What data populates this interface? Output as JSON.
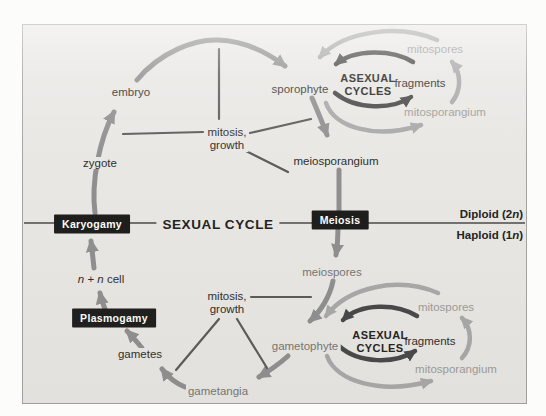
{
  "figure": {
    "type": "life-cycle-diagram",
    "halves": {
      "top": "Diploid (2n)",
      "bottom": "Haploid (1n)"
    }
  },
  "labels": {
    "embryo": "embryo",
    "zygote": "zygote",
    "sporophyte": "sporophyte",
    "meiosporangium": "meiosporangium",
    "meiospores": "meiospores",
    "gametophyte": "gametophyte",
    "gametangia": "gametangia",
    "gametes": "gametes",
    "fragments_top": "fragments",
    "fragments_bottom": "fragments",
    "mitospores_top": "mitospores",
    "mitosporangium_top": "mitosporangium",
    "mitospores_bottom": "mitospores",
    "mitosporangium_bottom": "mitosporangium",
    "mitosis_growth_top": {
      "line1": "mitosis,",
      "line2": "growth"
    },
    "mitosis_growth_bottom": {
      "line1": "mitosis,",
      "line2": "growth"
    },
    "asexual_cycles_top": {
      "line1": "ASEXUAL",
      "line2": "CYCLES"
    },
    "asexual_cycles_bottom": {
      "line1": "ASEXUAL",
      "line2": "CYCLES"
    },
    "sexual_cycle": "SEXUAL CYCLE",
    "n_n_cell": {
      "n1": "n",
      "plus": " + ",
      "n2": "n",
      "rest": " cell"
    },
    "diploid": {
      "prefix": "Diploid (2",
      "n": "n",
      "suffix": ")"
    },
    "haploid": {
      "prefix": "Haploid (1",
      "n": "n",
      "suffix": ")"
    }
  },
  "boxes": {
    "karyogamy": "Karyogamy",
    "meiosis": "Meiosis",
    "plasmogamy": "Plasmogamy"
  },
  "colors": {
    "panel_bg": "#e8e7e4",
    "panel_border": "#a3a2a0",
    "box_bg": "#1d1d1c",
    "box_text": "#ffffff",
    "arrow_sexual_cycle": "#8f8f8f",
    "arrow_asexual_inner": "#474747",
    "arrow_asexual_outer": "#a8a8a8",
    "thin_line": "#5a5a58",
    "midline": "#4a4a48",
    "text_dark": "#2e2d2b",
    "text_medium_gray": "#77756f",
    "text_light_gray": "#9d9b96"
  }
}
